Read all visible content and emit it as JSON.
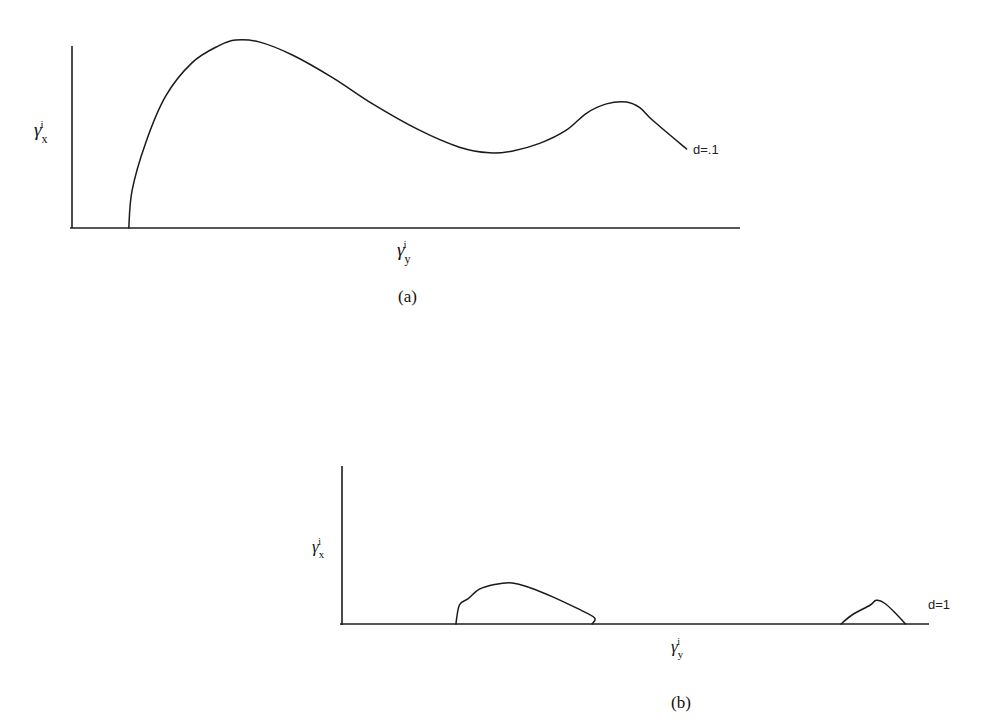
{
  "figure": {
    "panels": [
      "(a)",
      "(b)"
    ]
  },
  "chart_data": [
    {
      "type": "line",
      "panel_label": "(a)",
      "title": "",
      "xlabel": "γ_y^i",
      "ylabel": "γ_x^i",
      "xlabel_base": "γ",
      "xlabel_sub": "y",
      "xlabel_sup": "i",
      "ylabel_base": "γ",
      "ylabel_sub": "x",
      "ylabel_sup": "i",
      "xlim": [
        0,
        1
      ],
      "ylim": [
        0,
        1
      ],
      "grid": false,
      "ticks": "none",
      "series": [
        {
          "name": "d=.1",
          "label": "d=.1",
          "x": [
            0.085,
            0.09,
            0.11,
            0.14,
            0.18,
            0.22,
            0.245,
            0.28,
            0.33,
            0.39,
            0.45,
            0.52,
            0.58,
            0.625,
            0.66,
            0.7,
            0.74,
            0.77,
            0.8,
            0.83,
            0.85,
            0.87,
            0.92
          ],
          "y": [
            0.0,
            0.2,
            0.45,
            0.7,
            0.88,
            0.97,
            1.0,
            0.99,
            0.92,
            0.8,
            0.66,
            0.52,
            0.43,
            0.4,
            0.41,
            0.45,
            0.52,
            0.61,
            0.66,
            0.67,
            0.64,
            0.57,
            0.42
          ]
        }
      ]
    },
    {
      "type": "line",
      "panel_label": "(b)",
      "title": "",
      "xlabel": "γ_y^i",
      "ylabel": "γ_x^i",
      "xlabel_base": "γ",
      "xlabel_sub": "y",
      "xlabel_sup": "i",
      "ylabel_base": "γ",
      "ylabel_sub": "x",
      "ylabel_sup": "i",
      "xlim": [
        0,
        1
      ],
      "ylim": [
        0,
        1
      ],
      "grid": false,
      "ticks": "none",
      "series": [
        {
          "name": "d=1",
          "label": "d=1",
          "segments": [
            {
              "x": [
                0.194,
                0.2,
                0.215,
                0.234,
                0.26,
                0.29,
                0.32,
                0.36,
                0.4,
                0.43,
                0.426
              ],
              "y": [
                0.0,
                0.12,
                0.16,
                0.22,
                0.25,
                0.26,
                0.23,
                0.17,
                0.1,
                0.04,
                0.0
              ]
            },
            {
              "x": [
                0.85,
                0.87,
                0.9,
                0.91,
                0.925,
                0.945,
                0.96
              ],
              "y": [
                0.0,
                0.06,
                0.12,
                0.15,
                0.13,
                0.06,
                0.0
              ]
            }
          ]
        }
      ]
    }
  ]
}
